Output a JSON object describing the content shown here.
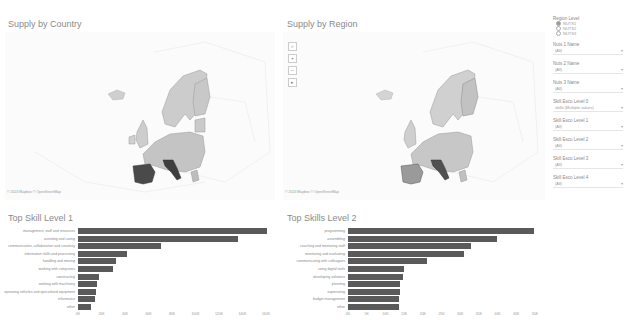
{
  "left_map": {
    "title": "Supply by Country",
    "credit": "© 2024 Mapbox © OpenStreetMap"
  },
  "right_map": {
    "title": "Supply by Region",
    "credit": "© 2024 Mapbox © OpenStreetMap",
    "controls": [
      "⌕",
      "+",
      "−",
      "▸"
    ]
  },
  "filters": {
    "region_level": {
      "label": "Region Level",
      "options": [
        "NUTS1",
        "NUTS2",
        "NUTS3"
      ],
      "selected": "NUTS1"
    },
    "dropdowns": [
      {
        "label": "Nuts 1 Name",
        "value": "(All)"
      },
      {
        "label": "Nuts 2 Name",
        "value": "(All)"
      },
      {
        "label": "Nuts 3 Name",
        "value": "(All)"
      },
      {
        "label": "Skill Esco Level 0",
        "value": "skills (Multiple values)"
      },
      {
        "label": "Skill Esco Level 1",
        "value": "(All)"
      },
      {
        "label": "Skill Esco Level 2",
        "value": "(All)"
      },
      {
        "label": "Skill Esco Level 3",
        "value": "(All)"
      },
      {
        "label": "Skill Esco Level 4",
        "value": "(All)"
      }
    ]
  },
  "chart_data": [
    {
      "type": "bar",
      "orientation": "horizontal",
      "title": "Top Skill Level 1",
      "categories": [
        "management, staff and resources",
        "assisting and caring",
        "communication, collaboration and creativity",
        "information skills and processing",
        "handling and moving",
        "working with computers",
        "constructing",
        "working with machinery",
        "operating vehicles and specialised equipment",
        "informatics",
        "other"
      ],
      "values": [
        161000,
        136000,
        71000,
        42000,
        32000,
        30000,
        18000,
        16000,
        15000,
        14500,
        11000
      ],
      "ticks": [
        "0K",
        "20K",
        "40K",
        "60K",
        "80K",
        "100K",
        "120K",
        "140K",
        "160K"
      ],
      "xlim": [
        0,
        160000
      ],
      "color": "#5a5a5a"
    },
    {
      "type": "bar",
      "orientation": "horizontal",
      "title": "Top Skills Level 2",
      "categories": [
        "programming",
        "assembling",
        "coaching and mentoring staff",
        "monitoring and evaluating",
        "communicating with colleagues",
        "using digital tools",
        "developing solutions",
        "planning",
        "supervising",
        "budget management",
        "other"
      ],
      "values": [
        49700,
        39800,
        33000,
        31000,
        21000,
        15000,
        14700,
        13900,
        13900,
        13600,
        13600
      ],
      "ticks": [
        "0K",
        "5K",
        "10K",
        "15K",
        "20K",
        "25K",
        "30K",
        "35K",
        "40K",
        "45K",
        "50K"
      ],
      "xlim": [
        0,
        50000
      ],
      "color": "#5a5a5a"
    }
  ]
}
